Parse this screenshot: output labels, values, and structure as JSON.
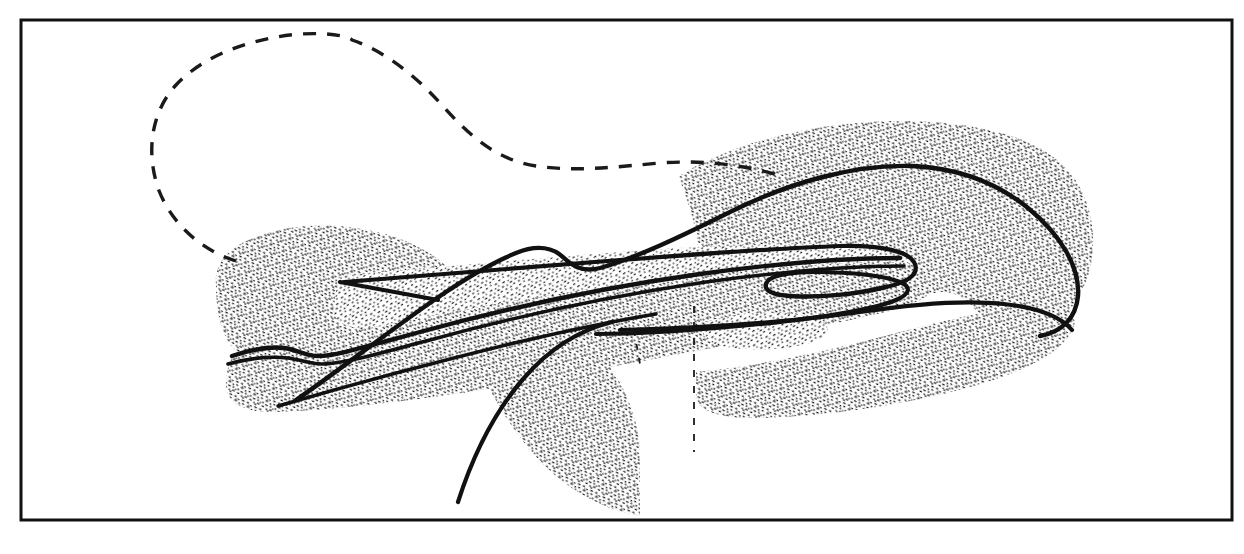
{
  "figure": {
    "kind": "hand-drawn-geological-cross-section",
    "caption": "",
    "title": "",
    "background_color": "#ffffff",
    "ink_color": "#111111",
    "stipple_color": "#1a1a1a",
    "frame": {
      "name": "figure-border",
      "x": 21,
      "y": 20,
      "width": 1211,
      "height": 500,
      "stroke_width": 3,
      "stroke_color": "#111111"
    },
    "canvas": {
      "width": 1244,
      "height": 554
    },
    "elements": [
      {
        "id": "dashed-balloon-outline",
        "label": "dashed reconstructed outline",
        "style": "dashed",
        "dash_pattern": "13 11",
        "stroke_width": 3.4,
        "path": "M 236 261 C 198 249 170 221 158 188 C 146 152 151 112 176 85 C 205 54 253 38 300 34 C 336 32 351 38 352 40 C 382 50 414 74 440 103 C 472 139 498 160 536 166 C 576 172 614 167 660 163 C 700 160 740 164 778 175"
      },
      {
        "id": "stipple-mass-upper-ridge",
        "label": "upper stippled ridge body",
        "style": "stipple",
        "path": "M 679 176 C 720 150 782 131 846 124 C 910 117 974 122 1020 139 C 1060 154 1082 180 1090 214 C 1098 250 1090 282 1074 304 C 1058 326 1036 336 1010 332 C 1000 330 992 326 986 320 L 966 300 C 952 290 938 290 926 296 C 912 303 902 302 896 294 L 880 272 C 868 258 856 250 842 247 C 826 244 812 249 800 258 L 770 280 C 752 292 736 294 722 286 C 708 278 700 264 698 246 C 696 222 686 200 679 176 Z"
      },
      {
        "id": "stipple-mass-left-hill",
        "label": "left stippled hill body",
        "style": "stipple",
        "path": "M 216 285 C 214 268 224 252 244 242 C 274 227 316 222 356 228 C 398 234 432 250 450 270 L 470 292 C 482 306 486 320 480 334 L 458 372 C 448 388 432 394 412 392 L 300 378 C 268 374 244 362 230 344 C 220 330 216 308 216 285 Z"
      },
      {
        "id": "stipple-mass-central-lens",
        "label": "central stippled fold lens",
        "style": "stipple",
        "path": "M 340 276 C 420 268 520 260 620 252 C 700 246 780 243 846 244 C 886 245 908 252 912 262 C 916 272 906 280 882 284 C 800 298 700 310 600 318 C 520 325 440 330 380 330 C 348 330 332 322 334 308 C 335 294 337 284 340 276 Z"
      },
      {
        "id": "stipple-mass-lower-band",
        "label": "lower stippled band",
        "style": "stipple",
        "path": "M 232 358 C 320 338 440 312 570 292 C 690 274 800 264 880 262 C 920 261 940 268 938 280 C 936 294 918 304 886 312 C 790 334 660 358 540 380 C 440 398 340 410 276 412 C 240 413 226 400 226 386 C 226 374 228 364 232 358 Z"
      },
      {
        "id": "stipple-mass-bottom-hook",
        "label": "bottom pendant stippled hook",
        "style": "stipple",
        "path": "M 550 328 C 572 330 592 342 608 364 C 626 388 636 416 640 444 L 640 516 L 616 510 C 580 498 548 474 522 440 C 496 406 478 370 470 336 C 484 328 506 324 550 328 Z"
      },
      {
        "id": "stipple-mass-right-lower",
        "label": "right lower stippled bench",
        "style": "stipple",
        "path": "M 696 372 C 760 366 832 350 900 332 C 960 316 1010 306 1046 306 C 1068 306 1078 314 1074 326 C 1068 344 1046 360 1010 374 C 940 400 840 416 760 418 C 716 419 698 410 696 396 Z"
      },
      {
        "id": "stipple-oval-island",
        "label": "small stippled oval island",
        "style": "stipple",
        "path": "M 706 322 C 736 312 778 310 806 316 C 830 321 834 332 818 340 C 796 350 752 352 722 346 C 702 342 698 328 706 322 Z"
      },
      {
        "id": "contour-upper-crest",
        "label": "upper bold contour crest line",
        "style": "solid",
        "stroke_width": 4.4,
        "path": "M 296 400 C 340 370 390 330 440 296 C 468 277 494 262 516 253 C 538 244 554 248 564 258 C 574 268 586 272 600 268 C 636 258 682 236 730 212 C 790 182 856 164 912 166 C 958 168 996 182 1028 208 C 1062 236 1080 268 1078 296 C 1076 318 1062 332 1040 336"
      },
      {
        "id": "contour-mid-upper",
        "label": "middle upper bold contour",
        "style": "solid",
        "stroke_width": 4.2,
        "path": "M 344 282 C 420 276 520 268 620 260 C 700 254 784 248 840 246 C 884 245 908 252 914 262 C 920 273 910 282 886 287"
      },
      {
        "id": "contour-fold-nose-upper",
        "label": "fold nose upper limb",
        "style": "solid",
        "stroke_width": 4.4,
        "path": "M 886 287 C 858 294 820 298 790 296 C 772 295 764 290 766 284"
      },
      {
        "id": "contour-fold-nose-lower",
        "label": "fold nose lower limb hinge",
        "style": "solid",
        "stroke_width": 4.2,
        "path": "M 766 284 C 768 276 788 272 816 272 C 852 272 886 276 900 282 C 912 287 910 294 896 300 C 872 310 820 318 760 324 C 700 330 640 334 596 334"
      },
      {
        "id": "contour-lower-limb-long",
        "label": "long lower limb bold line",
        "style": "solid",
        "stroke_width": 4.4,
        "path": "M 232 356 C 250 350 268 346 284 348 C 298 350 306 356 318 356 C 336 356 368 346 420 332 C 500 310 600 288 700 274 C 780 263 850 258 900 258"
      },
      {
        "id": "contour-lower-limb-parallel",
        "label": "parallel lower bold line",
        "style": "solid",
        "stroke_width": 3.6,
        "path": "M 228 364 C 250 358 270 356 288 358 C 302 360 310 364 322 364 C 342 364 376 354 430 340 C 510 318 610 296 706 282 C 786 271 854 266 904 266"
      },
      {
        "id": "contour-base-horizon",
        "label": "basal horizon bold line",
        "style": "solid",
        "stroke_width": 4.2,
        "path": "M 620 330 C 700 328 790 322 860 312 C 920 303 968 300 1004 304 C 1040 308 1062 318 1072 330"
      },
      {
        "id": "contour-left-tip-spur",
        "label": "left inner tip spur",
        "style": "solid",
        "stroke_width": 4.2,
        "path": "M 340 282 C 372 288 406 294 438 300"
      },
      {
        "id": "contour-lower-trailing-edge",
        "label": "lower trailing straight edge",
        "style": "solid",
        "stroke_width": 3.4,
        "path": "M 278 406 C 340 388 420 366 510 344 C 570 330 620 320 656 314"
      },
      {
        "id": "contour-hook-spine",
        "label": "bottom pendant hook spine",
        "style": "solid",
        "stroke_width": 4.2,
        "path": "M 612 322 C 580 330 550 348 524 378 C 496 410 474 452 458 502"
      },
      {
        "id": "dashed-vertical-marker",
        "label": "faint vertical dashed boundary",
        "style": "dashed",
        "dash_pattern": "7 9",
        "stroke_width": 1.8,
        "path": "M 694 306 L 694 452"
      },
      {
        "id": "dashed-hook-right-edge",
        "label": "faint dashed right edge of hook",
        "style": "dashed",
        "dash_pattern": "6 8",
        "stroke_width": 1.8,
        "path": "M 634 330 L 640 364"
      }
    ]
  }
}
